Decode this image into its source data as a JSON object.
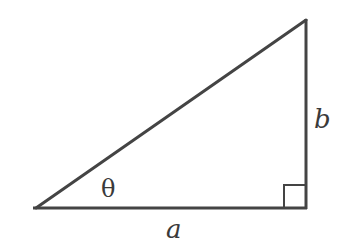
{
  "diagram": {
    "type": "right-triangle",
    "stroke_color": "#444444",
    "label_color": "#3a3a3a",
    "vertices": {
      "acute_vertex": [
        36,
        208
      ],
      "top_vertex": [
        306,
        20
      ],
      "right_angle_vertex": [
        306,
        208
      ]
    },
    "labels": {
      "angle": "θ",
      "base": "a",
      "height": "b"
    }
  }
}
